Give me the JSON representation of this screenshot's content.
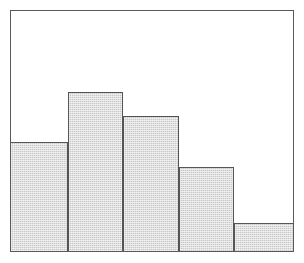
{
  "figure": {
    "kind": "histogram-figure",
    "width_px": 304,
    "height_px": 263,
    "background_color": "#ffffff",
    "frame": {
      "left_px": 10,
      "top_px": 10,
      "width_px": 284,
      "height_px": 242,
      "border_color": "#5a5a5a",
      "border_width_px": 1,
      "interior_color": "#ffffff"
    },
    "bar_style": {
      "fill_color": "#c9c9c9",
      "fill_pattern": "dithered-halftone-gray",
      "edge_color": "#555555",
      "edge_width_px": 1
    }
  },
  "chart_data": {
    "type": "bar",
    "title": "",
    "subtitle": "",
    "xlabel": "",
    "ylabel": "",
    "categories": [
      "1",
      "2",
      "3",
      "4",
      "5"
    ],
    "values": [
      45.5,
      66.1,
      56.2,
      35.1,
      11.6
    ],
    "xlim": [
      0,
      5
    ],
    "ylim": [
      0,
      100
    ],
    "grid": false,
    "legend": null,
    "legend_position": "none",
    "annotations": [],
    "tick_labels": {
      "x": [],
      "y": []
    },
    "bins": [
      {
        "index": 1,
        "label": "1",
        "value": 45.5,
        "x_start_pct": 0.0,
        "x_end_pct": 20.1
      },
      {
        "index": 2,
        "label": "2",
        "value": 66.1,
        "x_start_pct": 20.1,
        "x_end_pct": 39.7
      },
      {
        "index": 3,
        "label": "3",
        "value": 56.2,
        "x_start_pct": 39.7,
        "x_end_pct": 59.6
      },
      {
        "index": 4,
        "label": "4",
        "value": 35.1,
        "x_start_pct": 59.6,
        "x_end_pct": 79.1
      },
      {
        "index": 5,
        "label": "5",
        "value": 11.6,
        "x_start_pct": 79.1,
        "x_end_pct": 100.0
      }
    ]
  }
}
